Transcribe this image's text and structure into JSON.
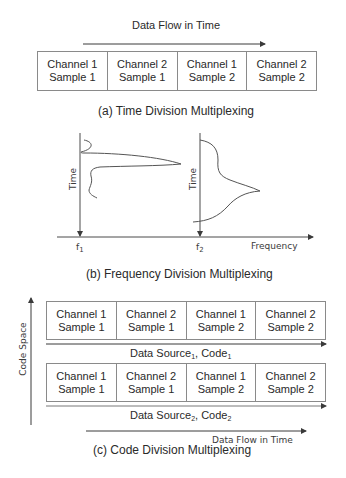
{
  "tdm": {
    "title": "Data Flow in Time",
    "caption": "(a) Time Division Multiplexing",
    "cells": [
      {
        "line1": "Channel 1",
        "line2": "Sample 1"
      },
      {
        "line1": "Channel 2",
        "line2": "Sample 1"
      },
      {
        "line1": "Channel 1",
        "line2": "Sample 2"
      },
      {
        "line1": "Channel 2",
        "line2": "Sample 2"
      }
    ]
  },
  "fdm": {
    "axis_y1_label": "Time",
    "axis_y2_label": "Time",
    "axis_x_label": "Frequency",
    "tick1": "f",
    "tick1_sub": "1",
    "tick2": "f",
    "tick2_sub": "2",
    "caption": "(b) Frequency Division Multiplexing"
  },
  "cdm": {
    "axis_label": "Code Space",
    "row1": {
      "cells": [
        {
          "line1": "Channel 1",
          "line2": "Sample 1"
        },
        {
          "line1": "Channel 2",
          "line2": "Sample 1"
        },
        {
          "line1": "Channel 1",
          "line2": "Sample 2"
        },
        {
          "line1": "Channel 2",
          "line2": "Sample 2"
        }
      ],
      "source": "Data Source",
      "source_sub": "1",
      "code": ", Code",
      "code_sub": "1"
    },
    "row2": {
      "cells": [
        {
          "line1": "Channel 1",
          "line2": "Sample 1"
        },
        {
          "line1": "Channel 2",
          "line2": "Sample 1"
        },
        {
          "line1": "Channel 1",
          "line2": "Sample 2"
        },
        {
          "line1": "Channel 2",
          "line2": "Sample 2"
        }
      ],
      "source": "Data Source",
      "source_sub": "2",
      "code": ", Code",
      "code_sub": "2"
    },
    "flow_label": "Data Flow in Time",
    "caption": "(c) Code Division Multiplexing"
  },
  "colors": {
    "line": "#4a4a4a",
    "border": "#8a8a8a",
    "text": "#2a2a2a"
  }
}
